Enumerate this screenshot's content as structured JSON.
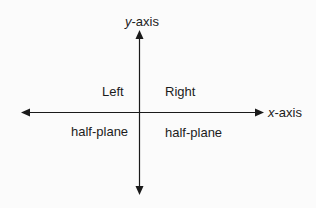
{
  "diagram": {
    "type": "coordinate-axes",
    "colors": {
      "background": "#fbfbfb",
      "stroke": "#1a1a1a",
      "text": "#1c1c1c"
    },
    "y_axis": {
      "var": "y",
      "suffix": "-axis"
    },
    "x_axis": {
      "var": "x",
      "suffix": "-axis"
    },
    "regions": {
      "left": {
        "line1": "Left",
        "line2": "half-plane"
      },
      "right": {
        "line1": "Right",
        "line2": "half-plane"
      }
    }
  }
}
